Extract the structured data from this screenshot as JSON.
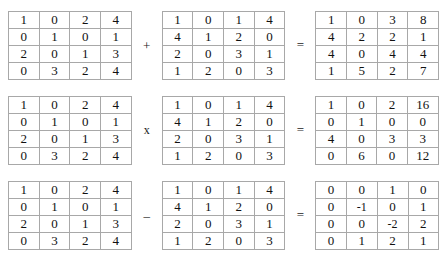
{
  "rows": [
    {
      "name": "addition",
      "operator": "+",
      "operator_name": "plus-operator",
      "equals": "=",
      "left": {
        "name": "matrix-a-addition",
        "cells": [
          [
            "1",
            "0",
            "2",
            "4"
          ],
          [
            "0",
            "1",
            "0",
            "1"
          ],
          [
            "2",
            "0",
            "1",
            "3"
          ],
          [
            "0",
            "3",
            "2",
            "4"
          ]
        ]
      },
      "right": {
        "name": "matrix-b-addition",
        "cells": [
          [
            "1",
            "0",
            "1",
            "4"
          ],
          [
            "4",
            "1",
            "2",
            "0"
          ],
          [
            "2",
            "0",
            "3",
            "1"
          ],
          [
            "1",
            "2",
            "0",
            "3"
          ]
        ]
      },
      "result": {
        "name": "matrix-result-addition",
        "cells": [
          [
            "1",
            "0",
            "3",
            "8"
          ],
          [
            "4",
            "2",
            "2",
            "1"
          ],
          [
            "4",
            "0",
            "4",
            "4"
          ],
          [
            "1",
            "5",
            "2",
            "7"
          ]
        ]
      }
    },
    {
      "name": "multiplication",
      "operator": "x",
      "operator_name": "multiply-operator",
      "equals": "=",
      "left": {
        "name": "matrix-a-multiplication",
        "cells": [
          [
            "1",
            "0",
            "2",
            "4"
          ],
          [
            "0",
            "1",
            "0",
            "1"
          ],
          [
            "2",
            "0",
            "1",
            "3"
          ],
          [
            "0",
            "3",
            "2",
            "4"
          ]
        ]
      },
      "right": {
        "name": "matrix-b-multiplication",
        "cells": [
          [
            "1",
            "0",
            "1",
            "4"
          ],
          [
            "4",
            "1",
            "2",
            "0"
          ],
          [
            "2",
            "0",
            "3",
            "1"
          ],
          [
            "1",
            "2",
            "0",
            "3"
          ]
        ]
      },
      "result": {
        "name": "matrix-result-multiplication",
        "cells": [
          [
            "1",
            "0",
            "2",
            "16"
          ],
          [
            "0",
            "1",
            "0",
            "0"
          ],
          [
            "4",
            "0",
            "3",
            "3"
          ],
          [
            "0",
            "6",
            "0",
            "12"
          ]
        ]
      }
    },
    {
      "name": "subtraction",
      "operator": "–",
      "operator_name": "minus-operator",
      "equals": "=",
      "left": {
        "name": "matrix-a-subtraction",
        "cells": [
          [
            "1",
            "0",
            "2",
            "4"
          ],
          [
            "0",
            "1",
            "0",
            "1"
          ],
          [
            "2",
            "0",
            "1",
            "3"
          ],
          [
            "0",
            "3",
            "2",
            "4"
          ]
        ]
      },
      "right": {
        "name": "matrix-b-subtraction",
        "cells": [
          [
            "1",
            "0",
            "1",
            "4"
          ],
          [
            "4",
            "1",
            "2",
            "0"
          ],
          [
            "2",
            "0",
            "3",
            "1"
          ],
          [
            "1",
            "2",
            "0",
            "3"
          ]
        ]
      },
      "result": {
        "name": "matrix-result-subtraction",
        "cells": [
          [
            "0",
            "0",
            "1",
            "0"
          ],
          [
            "0",
            "-1",
            "0",
            "1"
          ],
          [
            "0",
            "0",
            "-2",
            "2"
          ],
          [
            "0",
            "1",
            "2",
            "1"
          ]
        ]
      }
    }
  ],
  "colors": {
    "outer_border": "#8a8a8a",
    "inner_border": "#a8a8a8",
    "text": "#111111",
    "background": "#ffffff"
  }
}
